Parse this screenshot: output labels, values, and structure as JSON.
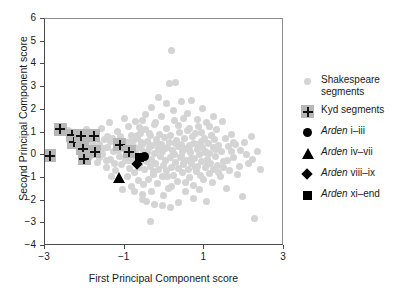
{
  "chart_data": {
    "type": "scatter",
    "title": "",
    "xlabel": "First Principal Component score",
    "ylabel": "Second Principal Component score",
    "xlim": [
      -3,
      3
    ],
    "ylim": [
      -4,
      6
    ],
    "xticks": [
      -3,
      -1,
      1,
      3
    ],
    "xtick_labels": [
      "−3",
      "−1",
      "1",
      "3"
    ],
    "yticks": [
      -4,
      -3,
      -2,
      -1,
      0,
      1,
      2,
      3,
      4,
      5,
      6
    ],
    "ytick_labels": [
      "−4",
      "−3",
      "−2",
      "−1",
      "0",
      "1",
      "2",
      "3",
      "4",
      "5",
      "6"
    ],
    "grid": false,
    "legend_position": "right",
    "legend": [
      {
        "marker": "gray-circle",
        "label": "Shakespeare segments",
        "color": "#d4d4d4"
      },
      {
        "marker": "plus-square",
        "label": "Kyd segments",
        "color": "#b7b7b7"
      },
      {
        "marker": "circle",
        "label_italic": "Arden",
        "label_rest": " i–iii",
        "color": "#000000"
      },
      {
        "marker": "triangle",
        "label_italic": "Arden",
        "label_rest": " iv–vii",
        "color": "#000000"
      },
      {
        "marker": "diamond",
        "label_italic": "Arden",
        "label_rest": " viii–ix",
        "color": "#000000"
      },
      {
        "marker": "square",
        "label_italic": "Arden",
        "label_rest": " xi–end",
        "color": "#000000"
      }
    ],
    "series": [
      {
        "name": "Shakespeare segments",
        "marker": "gray-circle",
        "color": "#d4d4d4",
        "points": [
          [
            -2.35,
            0.62
          ],
          [
            -2.18,
            0.45
          ],
          [
            -2.12,
            1.02
          ],
          [
            -2.05,
            0.12
          ],
          [
            -1.98,
            0.38
          ],
          [
            -1.92,
            0.88
          ],
          [
            -1.88,
            -0.12
          ],
          [
            -1.82,
            0.55
          ],
          [
            -1.78,
            0.22
          ],
          [
            -1.72,
            0.95
          ],
          [
            -1.68,
            -0.32
          ],
          [
            -1.62,
            0.45
          ],
          [
            -1.58,
            1.18
          ],
          [
            -1.55,
            0.02
          ],
          [
            -1.5,
            0.68
          ],
          [
            -1.46,
            -0.55
          ],
          [
            -1.42,
            0.35
          ],
          [
            -1.38,
            1.42
          ],
          [
            -1.35,
            -0.18
          ],
          [
            -1.3,
            0.75
          ],
          [
            -1.28,
            0.15
          ],
          [
            -1.24,
            -0.68
          ],
          [
            -1.2,
            0.52
          ],
          [
            -1.18,
            1.05
          ],
          [
            -1.14,
            -0.05
          ],
          [
            -1.1,
            0.82
          ],
          [
            -1.08,
            -0.42
          ],
          [
            -1.04,
            0.28
          ],
          [
            -1.0,
            1.62
          ],
          [
            -0.98,
            -0.22
          ],
          [
            -0.96,
            0.58
          ],
          [
            -0.94,
            -0.95
          ],
          [
            -0.92,
            0.05
          ],
          [
            -0.9,
            1.25
          ],
          [
            -0.88,
            -0.58
          ],
          [
            -0.86,
            0.42
          ],
          [
            -0.84,
            -1.38
          ],
          [
            -0.82,
            0.88
          ],
          [
            -0.8,
            -0.15
          ],
          [
            -0.78,
            0.65
          ],
          [
            -0.76,
            -0.78
          ],
          [
            -0.74,
            0.18
          ],
          [
            -0.72,
            1.48
          ],
          [
            -0.7,
            -0.35
          ],
          [
            -0.68,
            0.72
          ],
          [
            -0.66,
            -1.12
          ],
          [
            -0.64,
            0.32
          ],
          [
            -0.62,
            -0.52
          ],
          [
            -0.6,
            0.95
          ],
          [
            -0.58,
            -0.08
          ],
          [
            -0.56,
            0.48
          ],
          [
            -0.54,
            -1.72
          ],
          [
            -0.52,
            0.18
          ],
          [
            -0.5,
            -0.62
          ],
          [
            -0.48,
            1.12
          ],
          [
            -0.46,
            0.05
          ],
          [
            -0.44,
            -0.28
          ],
          [
            -0.42,
            0.62
          ],
          [
            -0.4,
            -1.05
          ],
          [
            -0.38,
            0.35
          ],
          [
            -0.36,
            -0.48
          ],
          [
            -0.34,
            0.85
          ],
          [
            -0.32,
            -0.18
          ],
          [
            -0.3,
            0.42
          ],
          [
            -0.28,
            -0.85
          ],
          [
            -0.26,
            1.35
          ],
          [
            -0.24,
            0.08
          ],
          [
            -0.22,
            -0.38
          ],
          [
            -0.2,
            0.68
          ],
          [
            -0.18,
            -1.25
          ],
          [
            -0.16,
            0.25
          ],
          [
            -0.14,
            -0.62
          ],
          [
            -0.12,
            0.92
          ],
          [
            -0.1,
            -0.05
          ],
          [
            -0.08,
            0.48
          ],
          [
            -0.06,
            -0.95
          ],
          [
            -0.04,
            0.15
          ],
          [
            -0.02,
            -0.45
          ],
          [
            0.0,
            0.78
          ],
          [
            0.02,
            -0.22
          ],
          [
            0.04,
            1.18
          ],
          [
            0.06,
            -0.68
          ],
          [
            0.08,
            0.32
          ],
          [
            0.1,
            -1.45
          ],
          [
            0.12,
            0.58
          ],
          [
            0.14,
            -0.12
          ],
          [
            0.16,
            0.88
          ],
          [
            0.18,
            -0.52
          ],
          [
            0.2,
            0.22
          ],
          [
            0.22,
            -0.88
          ],
          [
            0.24,
            1.52
          ],
          [
            0.26,
            0.05
          ],
          [
            0.28,
            -0.32
          ],
          [
            0.3,
            0.65
          ],
          [
            0.32,
            -1.18
          ],
          [
            0.34,
            0.38
          ],
          [
            0.36,
            -0.58
          ],
          [
            0.38,
            0.98
          ],
          [
            0.4,
            -0.08
          ],
          [
            0.42,
            0.45
          ],
          [
            0.44,
            -0.78
          ],
          [
            0.46,
            0.18
          ],
          [
            0.48,
            -0.42
          ],
          [
            0.5,
            0.72
          ],
          [
            0.52,
            -1.62
          ],
          [
            0.54,
            0.28
          ],
          [
            0.56,
            -0.25
          ],
          [
            0.58,
            1.08
          ],
          [
            0.6,
            -0.62
          ],
          [
            0.62,
            0.42
          ],
          [
            0.64,
            -0.98
          ],
          [
            0.66,
            0.12
          ],
          [
            0.68,
            -0.35
          ],
          [
            0.7,
            0.82
          ],
          [
            0.72,
            -1.32
          ],
          [
            0.74,
            0.52
          ],
          [
            0.76,
            -0.15
          ],
          [
            0.78,
            0.95
          ],
          [
            0.8,
            -0.72
          ],
          [
            0.82,
            0.25
          ],
          [
            0.84,
            -0.48
          ],
          [
            0.86,
            1.28
          ],
          [
            0.88,
            0.02
          ],
          [
            0.9,
            -0.88
          ],
          [
            0.92,
            0.62
          ],
          [
            0.94,
            -0.28
          ],
          [
            0.96,
            0.35
          ],
          [
            0.98,
            -1.08
          ],
          [
            1.0,
            0.75
          ],
          [
            1.02,
            -0.55
          ],
          [
            1.04,
            0.18
          ],
          [
            1.06,
            1.42
          ],
          [
            1.08,
            -0.18
          ],
          [
            1.1,
            0.52
          ],
          [
            1.12,
            -0.82
          ],
          [
            1.14,
            0.08
          ],
          [
            1.16,
            -0.38
          ],
          [
            1.18,
            0.88
          ],
          [
            1.2,
            -1.22
          ],
          [
            1.22,
            0.32
          ],
          [
            1.24,
            -0.62
          ],
          [
            1.26,
            0.68
          ],
          [
            1.28,
            -0.05
          ],
          [
            1.3,
            1.15
          ],
          [
            1.32,
            -0.45
          ],
          [
            1.36,
            0.42
          ],
          [
            1.4,
            -0.95
          ],
          [
            1.44,
            0.15
          ],
          [
            1.48,
            -0.28
          ],
          [
            1.52,
            0.72
          ],
          [
            1.56,
            -1.48
          ],
          [
            1.6,
            0.38
          ],
          [
            1.64,
            -0.68
          ],
          [
            1.68,
            0.92
          ],
          [
            1.72,
            -0.12
          ],
          [
            1.78,
            0.48
          ],
          [
            1.84,
            -0.85
          ],
          [
            1.9,
            0.22
          ],
          [
            1.96,
            -1.82
          ],
          [
            2.02,
            0.58
          ],
          [
            2.1,
            -0.38
          ],
          [
            2.18,
            0.82
          ],
          [
            2.26,
            -2.78
          ],
          [
            2.34,
            0.18
          ],
          [
            2.42,
            -0.62
          ],
          [
            0.18,
            4.62
          ],
          [
            0.12,
            3.18
          ],
          [
            0.28,
            3.22
          ],
          [
            0.05,
            2.28
          ],
          [
            0.42,
            2.35
          ],
          [
            -0.32,
            2.08
          ],
          [
            0.58,
            1.85
          ],
          [
            0.95,
            2.05
          ],
          [
            -0.48,
            1.78
          ],
          [
            1.22,
            1.72
          ],
          [
            -0.15,
            2.52
          ],
          [
            0.68,
            2.42
          ],
          [
            -0.55,
            1.52
          ],
          [
            1.45,
            1.48
          ],
          [
            -0.62,
            1.22
          ],
          [
            -0.45,
            -2.05
          ],
          [
            -0.25,
            -2.18
          ],
          [
            -0.35,
            -2.92
          ],
          [
            -0.05,
            -2.22
          ],
          [
            0.15,
            -2.32
          ],
          [
            0.35,
            -2.08
          ],
          [
            -0.55,
            -1.95
          ],
          [
            0.72,
            -1.92
          ],
          [
            1.05,
            -2.05
          ],
          [
            -0.75,
            -1.58
          ],
          [
            -1.45,
            -0.22
          ],
          [
            -1.52,
            0.28
          ],
          [
            -1.62,
            -0.08
          ],
          [
            -1.35,
            0.62
          ],
          [
            -1.25,
            -0.38
          ],
          [
            -2.42,
            1.08
          ],
          [
            -2.28,
            0.92
          ],
          [
            -1.95,
            1.12
          ],
          [
            -1.85,
            0.72
          ],
          [
            -1.75,
            0.38
          ],
          [
            0.22,
            1.95
          ],
          [
            0.48,
            1.62
          ],
          [
            0.82,
            1.58
          ],
          [
            1.12,
            1.28
          ],
          [
            -0.08,
            1.72
          ],
          [
            -0.22,
            1.45
          ],
          [
            0.35,
            1.32
          ],
          [
            0.62,
            1.18
          ],
          [
            0.92,
            1.02
          ],
          [
            1.18,
            0.88
          ],
          [
            -0.68,
            0.88
          ],
          [
            -0.58,
            0.58
          ],
          [
            -0.38,
            0.95
          ],
          [
            -0.18,
            0.52
          ],
          [
            0.02,
            0.28
          ],
          [
            0.22,
            0.08
          ],
          [
            0.42,
            -0.05
          ],
          [
            0.62,
            0.22
          ],
          [
            0.82,
            0.45
          ],
          [
            1.02,
            0.12
          ],
          [
            -0.88,
            -0.25
          ],
          [
            -0.78,
            0.38
          ],
          [
            -0.58,
            -0.18
          ],
          [
            -0.42,
            0.12
          ],
          [
            -0.28,
            -0.72
          ],
          [
            -0.12,
            0.35
          ],
          [
            0.08,
            -0.92
          ],
          [
            0.28,
            0.52
          ],
          [
            0.48,
            -0.35
          ],
          [
            0.68,
            -0.15
          ],
          [
            0.88,
            -1.52
          ],
          [
            1.08,
            -0.42
          ],
          [
            1.28,
            0.25
          ],
          [
            1.48,
            -0.55
          ],
          [
            1.68,
            0.18
          ],
          [
            -1.05,
            -1.52
          ],
          [
            -0.95,
            0.45
          ],
          [
            -1.15,
            0.22
          ],
          [
            -1.32,
            -0.92
          ],
          [
            -1.42,
            0.82
          ],
          [
            -0.52,
            -1.28
          ],
          [
            -0.32,
            -1.62
          ],
          [
            0.52,
            -1.22
          ],
          [
            0.78,
            -0.52
          ],
          [
            1.35,
            -0.78
          ],
          [
            -0.02,
            -1.78
          ],
          [
            0.18,
            -1.38
          ],
          [
            -0.62,
            -0.42
          ],
          [
            -0.72,
            0.15
          ],
          [
            -0.86,
            0.62
          ],
          [
            1.58,
            -0.22
          ],
          [
            1.74,
            0.55
          ],
          [
            1.88,
            -0.48
          ],
          [
            2.06,
            0.05
          ],
          [
            2.22,
            -0.18
          ]
        ]
      },
      {
        "name": "Kyd segments",
        "marker": "plus-square",
        "color": "#b7b7b7",
        "points": [
          [
            -2.88,
            -0.02
          ],
          [
            -2.62,
            1.15
          ],
          [
            -2.32,
            0.88
          ],
          [
            -2.28,
            0.58
          ],
          [
            -2.1,
            0.85
          ],
          [
            -2.05,
            0.28
          ],
          [
            -2.02,
            -0.15
          ],
          [
            -1.78,
            0.85
          ],
          [
            -1.75,
            0.15
          ],
          [
            -1.12,
            0.45
          ],
          [
            -0.88,
            0.15
          ]
        ]
      },
      {
        "name": "Arden i–iii",
        "marker": "circle",
        "color": "#000000",
        "points": [
          [
            -0.5,
            -0.05
          ]
        ]
      },
      {
        "name": "Arden iv–vii",
        "marker": "triangle",
        "color": "#000000",
        "points": [
          [
            -1.15,
            -1.0
          ]
        ]
      },
      {
        "name": "Arden viii–ix",
        "marker": "diamond",
        "color": "#000000",
        "points": [
          [
            -0.68,
            -0.38
          ]
        ]
      },
      {
        "name": "Arden xi–end",
        "marker": "square",
        "color": "#000000",
        "points": [
          [
            -0.62,
            -0.08
          ]
        ]
      }
    ]
  }
}
